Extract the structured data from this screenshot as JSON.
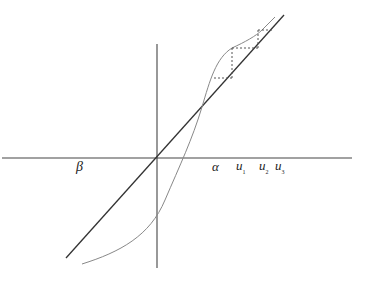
{
  "figure": {
    "colors": {
      "axis": "#444444",
      "line": "#333333",
      "curve": "#888888",
      "dotted": "#555555"
    },
    "labels": {
      "beta": "β",
      "alpha": "α",
      "u1_base": "u",
      "u1_sub": "1",
      "u2_base": "u",
      "u2_sub": "2",
      "u3_base": "u",
      "u3_sub": "3"
    }
  }
}
